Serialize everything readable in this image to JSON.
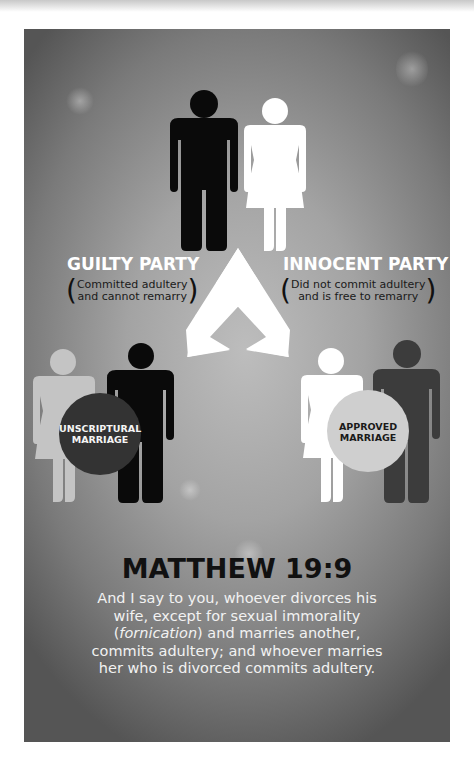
{
  "colors": {
    "page_bg": "#ffffff",
    "panel_center": "#bdbdbd",
    "panel_edge": "#555555",
    "black_figure": "#0a0a0a",
    "white_figure": "#ffffff",
    "light_gray_figure": "#c4c4c4",
    "dark_gray_figure": "#3c3c3c",
    "unscriptural_circle": "#333333",
    "approved_circle": "#cfcfcf",
    "title_text": "#ffffff",
    "verse_title": "#111111",
    "verse_body": "#f2f2f2"
  },
  "top_couple": {
    "man": {
      "label": "man-figure-black"
    },
    "woman": {
      "label": "woman-figure-white"
    }
  },
  "guilty": {
    "title": "GUILTY PARTY",
    "line1": "Committed adultery",
    "line2": "and cannot remarry"
  },
  "innocent": {
    "title": "INNOCENT PARTY",
    "line1": "Did not commit adultery",
    "line2": "and is free to remarry"
  },
  "arrows": {
    "left": "arrow-down-left",
    "right": "arrow-down-right"
  },
  "bottom_left": {
    "circle_line1": "UNSCRIPTURAL",
    "circle_line2": "MARRIAGE"
  },
  "bottom_right": {
    "circle_line1": "APPROVED",
    "circle_line2": "MARRIAGE"
  },
  "verse": {
    "reference": "MATTHEW 19:9",
    "line1": "And I say to you, whoever divorces his",
    "line2": "wife, except for sexual immorality",
    "line3_open": "(",
    "line3_italic": "fornication",
    "line3_rest": ") and marries another,",
    "line4": "commits adultery; and whoever marries",
    "line5": "her who is divorced commits adultery."
  }
}
